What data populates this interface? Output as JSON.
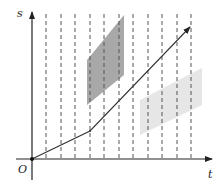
{
  "diagram": {
    "axes": {
      "x_label": "t",
      "y_label": "s",
      "origin_label": "O",
      "origin": [
        32,
        159
      ],
      "x_end": [
        212,
        159
      ],
      "y_end": [
        32,
        12
      ]
    },
    "gridlines": {
      "style": "dashed",
      "x_positions": [
        46,
        61,
        75,
        90,
        104,
        119,
        133,
        148,
        162,
        177,
        191
      ],
      "y_top": 14,
      "y_bottom": 159
    },
    "path": {
      "points": [
        [
          32,
          159
        ],
        [
          90,
          131
        ],
        [
          190,
          27
        ]
      ],
      "description": "polyline from origin with a kink, ending in arrow"
    },
    "regions": [
      {
        "name": "dark-parallelogram",
        "color": "#a8a8a8",
        "points": [
          [
            87,
            60
          ],
          [
            124,
            15
          ],
          [
            124,
            75
          ],
          [
            87,
            105
          ]
        ]
      },
      {
        "name": "light-parallelogram",
        "color": "#e6e6e6",
        "points": [
          [
            140,
            100
          ],
          [
            202,
            68
          ],
          [
            202,
            105
          ],
          [
            140,
            135
          ]
        ]
      }
    ],
    "colors": {
      "axis": "#222222",
      "gridline": "#555555",
      "path": "#333333"
    }
  }
}
